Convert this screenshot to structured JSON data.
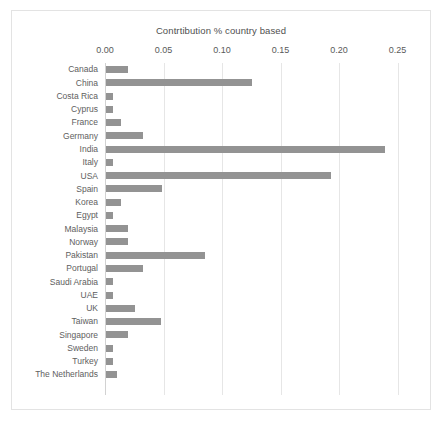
{
  "chart_data": {
    "type": "bar",
    "orientation": "horizontal",
    "title": "Contrtibution % country based",
    "xlabel": "",
    "ylabel": "",
    "xlim": [
      0.0,
      0.27
    ],
    "xticks": [
      0.0,
      0.05,
      0.1,
      0.15,
      0.2,
      0.25
    ],
    "xtick_labels": [
      "0.00",
      "0.05",
      "0.10",
      "0.15",
      "0.20",
      "0.25"
    ],
    "grid": true,
    "legend": false,
    "bar_color": "#939393",
    "categories": [
      "Canada",
      "China",
      "Costa Rica",
      "Cyprus",
      "France",
      "Germany",
      "India",
      "Italy",
      "USA",
      "Spain",
      "Korea",
      "Egypt",
      "Malaysia",
      "Norway",
      "Pakistan",
      "Portugal",
      "Saudi Arabia",
      "UAE",
      "UK",
      "Taiwan",
      "Singapore",
      "Sweden",
      "Turkey",
      "The Netherlands"
    ],
    "values": [
      0.019,
      0.125,
      0.006,
      0.006,
      0.013,
      0.032,
      0.238,
      0.006,
      0.192,
      0.048,
      0.013,
      0.006,
      0.019,
      0.019,
      0.085,
      0.032,
      0.006,
      0.006,
      0.025,
      0.047,
      0.019,
      0.006,
      0.006,
      0.009
    ]
  },
  "caption": ""
}
